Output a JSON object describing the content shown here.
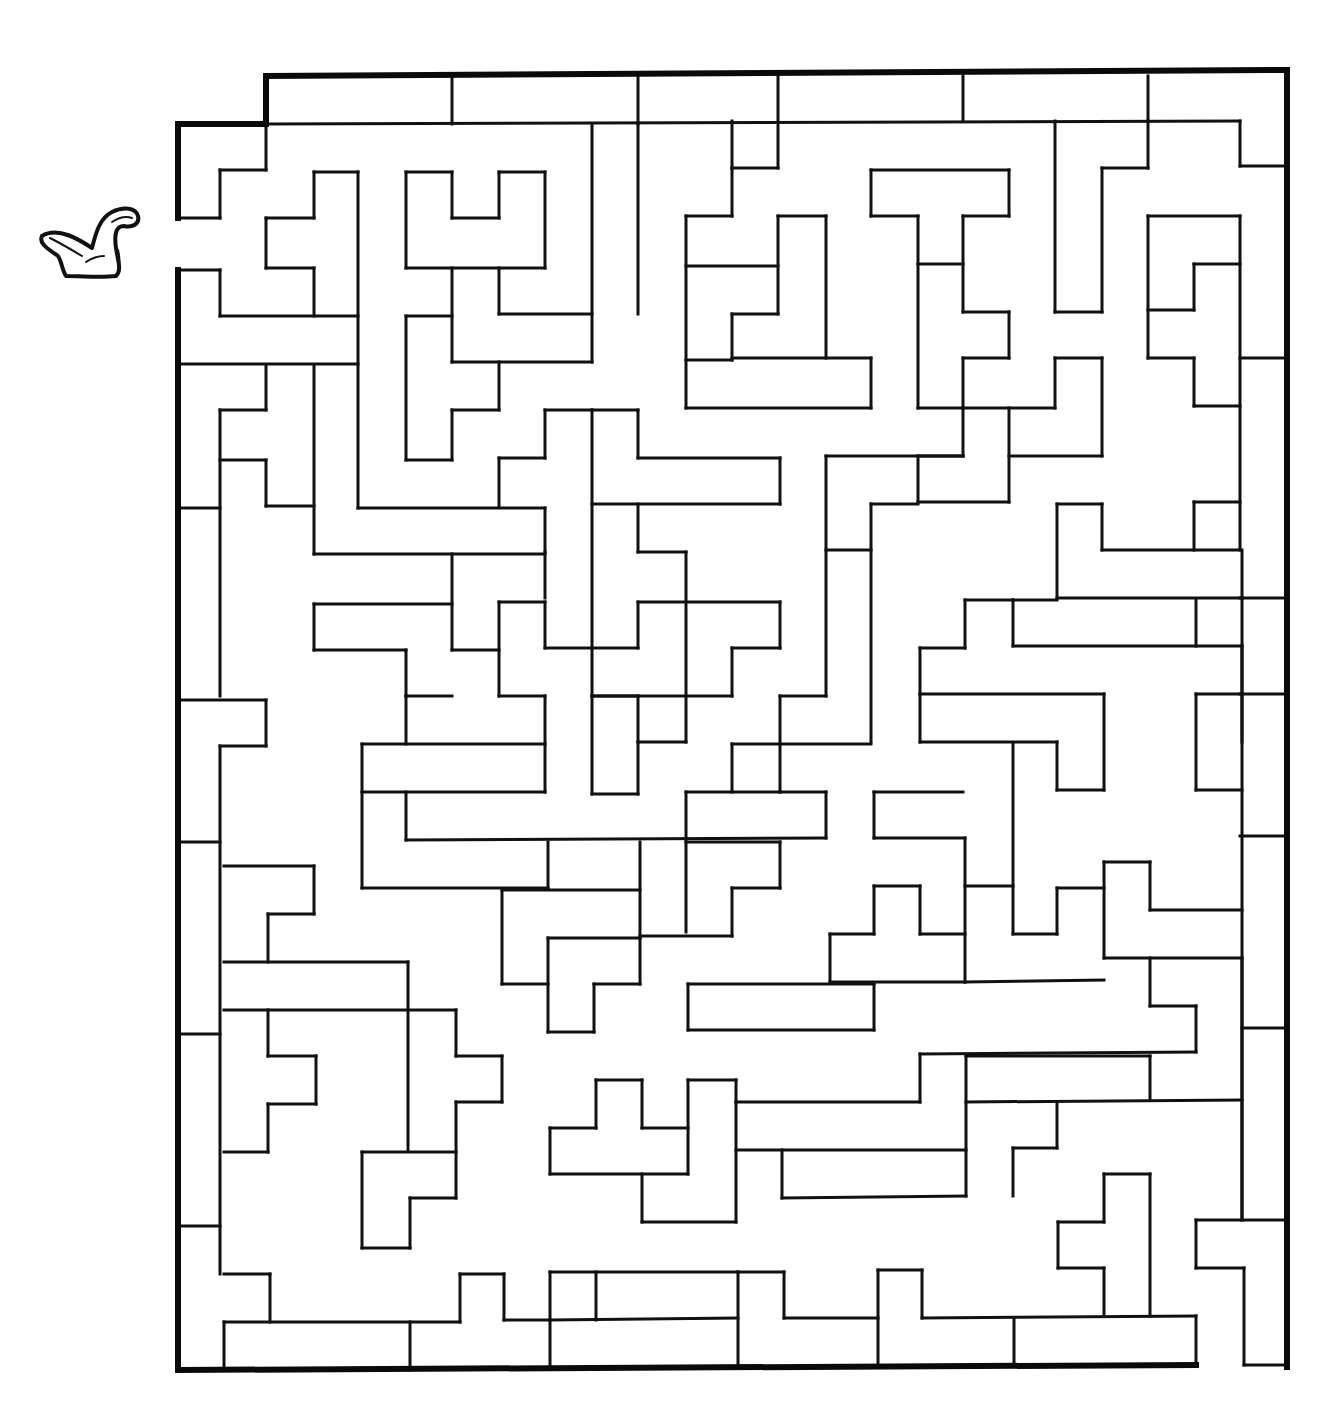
{
  "puzzle": {
    "type": "maze",
    "entrance": {
      "side": "left",
      "x": 178,
      "y_from": 218,
      "y_to": 270
    },
    "exit": {
      "side": "bottom-right",
      "x_from": 1196,
      "x_to": 1287,
      "y": 1367
    },
    "icon": "bird-icon",
    "colors": {
      "background": "#ffffff",
      "wall": "#111111"
    }
  },
  "border": [
    [
      266,
      76,
      1287,
      70
    ],
    [
      1287,
      70,
      1287,
      1367
    ],
    [
      178,
      1370,
      1196,
      1365
    ],
    [
      178,
      124,
      266,
      124
    ],
    [
      266,
      76,
      266,
      124
    ],
    [
      178,
      124,
      178,
      218
    ],
    [
      178,
      270,
      178,
      1370
    ]
  ],
  "walls": [
    [
      266,
      124,
      1240,
      121
    ],
    [
      452,
      76,
      452,
      124
    ],
    [
      638,
      76,
      638,
      124
    ],
    [
      778,
      76,
      778,
      168
    ],
    [
      963,
      76,
      963,
      121
    ],
    [
      1148,
      76,
      1148,
      121
    ],
    [
      1240,
      121,
      1240,
      166
    ],
    [
      1240,
      166,
      1287,
      166
    ],
    [
      266,
      124,
      266,
      170
    ],
    [
      220,
      170,
      266,
      170
    ],
    [
      220,
      170,
      220,
      218
    ],
    [
      178,
      218,
      220,
      218
    ],
    [
      314,
      172,
      358,
      172
    ],
    [
      314,
      172,
      314,
      218
    ],
    [
      266,
      218,
      314,
      218
    ],
    [
      266,
      218,
      266,
      268
    ],
    [
      266,
      268,
      314,
      268
    ],
    [
      314,
      268,
      314,
      316
    ],
    [
      358,
      172,
      358,
      508
    ],
    [
      220,
      270,
      220,
      316
    ],
    [
      220,
      316,
      358,
      316
    ],
    [
      178,
      270,
      220,
      270
    ],
    [
      178,
      364,
      358,
      364
    ],
    [
      406,
      172,
      452,
      172
    ],
    [
      452,
      172,
      452,
      218
    ],
    [
      452,
      218,
      499,
      218
    ],
    [
      499,
      172,
      499,
      218
    ],
    [
      499,
      172,
      545,
      172
    ],
    [
      545,
      172,
      545,
      268
    ],
    [
      406,
      172,
      406,
      268
    ],
    [
      406,
      268,
      545,
      268
    ],
    [
      452,
      268,
      452,
      362
    ],
    [
      499,
      268,
      499,
      314
    ],
    [
      499,
      314,
      592,
      314
    ],
    [
      592,
      124,
      592,
      362
    ],
    [
      452,
      362,
      592,
      362
    ],
    [
      638,
      124,
      638,
      314
    ],
    [
      406,
      316,
      452,
      316
    ],
    [
      406,
      316,
      406,
      460
    ],
    [
      406,
      460,
      452,
      460
    ],
    [
      452,
      410,
      452,
      460
    ],
    [
      452,
      410,
      499,
      410
    ],
    [
      499,
      362,
      499,
      410
    ],
    [
      732,
      121,
      732,
      168
    ],
    [
      732,
      168,
      778,
      168
    ],
    [
      732,
      168,
      732,
      216
    ],
    [
      686,
      216,
      732,
      216
    ],
    [
      686,
      216,
      686,
      408
    ],
    [
      686,
      266,
      778,
      266
    ],
    [
      778,
      216,
      778,
      314
    ],
    [
      778,
      216,
      826,
      216
    ],
    [
      826,
      216,
      826,
      358
    ],
    [
      732,
      314,
      778,
      314
    ],
    [
      732,
      314,
      732,
      360
    ],
    [
      732,
      358,
      871,
      358
    ],
    [
      686,
      360,
      732,
      360
    ],
    [
      686,
      408,
      871,
      408
    ],
    [
      871,
      358,
      871,
      408
    ],
    [
      871,
      170,
      1009,
      170
    ],
    [
      871,
      170,
      871,
      216
    ],
    [
      871,
      216,
      918,
      216
    ],
    [
      918,
      216,
      918,
      408
    ],
    [
      963,
      216,
      1009,
      216
    ],
    [
      1009,
      170,
      1009,
      216
    ],
    [
      918,
      264,
      963,
      264
    ],
    [
      963,
      216,
      963,
      312
    ],
    [
      963,
      312,
      1009,
      312
    ],
    [
      1009,
      312,
      1009,
      358
    ],
    [
      963,
      358,
      1009,
      358
    ],
    [
      963,
      358,
      963,
      408
    ],
    [
      918,
      408,
      1055,
      408
    ],
    [
      1055,
      121,
      1055,
      312
    ],
    [
      1055,
      312,
      1102,
      312
    ],
    [
      1102,
      168,
      1102,
      312
    ],
    [
      1102,
      168,
      1148,
      168
    ],
    [
      1148,
      121,
      1148,
      168
    ],
    [
      1148,
      216,
      1240,
      216
    ],
    [
      1148,
      216,
      1148,
      358
    ],
    [
      1148,
      310,
      1194,
      310
    ],
    [
      1194,
      264,
      1194,
      310
    ],
    [
      1194,
      264,
      1240,
      264
    ],
    [
      1240,
      216,
      1240,
      550
    ],
    [
      1148,
      358,
      1194,
      358
    ],
    [
      1194,
      358,
      1194,
      406
    ],
    [
      1194,
      406,
      1240,
      406
    ],
    [
      1240,
      358,
      1287,
      358
    ],
    [
      1055,
      358,
      1102,
      358
    ],
    [
      1055,
      358,
      1055,
      408
    ],
    [
      1102,
      358,
      1102,
      456
    ],
    [
      1009,
      456,
      1102,
      456
    ],
    [
      1009,
      408,
      1009,
      502
    ],
    [
      963,
      408,
      963,
      456
    ],
    [
      918,
      456,
      963,
      456
    ],
    [
      918,
      456,
      918,
      502
    ],
    [
      918,
      502,
      1009,
      502
    ],
    [
      826,
      456,
      963,
      456
    ],
    [
      826,
      456,
      826,
      696
    ],
    [
      871,
      504,
      918,
      504
    ],
    [
      871,
      504,
      871,
      742
    ],
    [
      826,
      550,
      871,
      550
    ],
    [
      178,
      508,
      220,
      508
    ],
    [
      220,
      410,
      266,
      410
    ],
    [
      220,
      410,
      220,
      696
    ],
    [
      266,
      366,
      266,
      410
    ],
    [
      220,
      460,
      266,
      460
    ],
    [
      266,
      460,
      266,
      506
    ],
    [
      266,
      506,
      314,
      506
    ],
    [
      314,
      366,
      314,
      554
    ],
    [
      314,
      554,
      545,
      554
    ],
    [
      358,
      508,
      545,
      508
    ],
    [
      545,
      508,
      545,
      552
    ],
    [
      545,
      410,
      592,
      410
    ],
    [
      545,
      410,
      545,
      458
    ],
    [
      499,
      458,
      545,
      458
    ],
    [
      499,
      458,
      499,
      506
    ],
    [
      592,
      410,
      638,
      410
    ],
    [
      638,
      410,
      638,
      458
    ],
    [
      638,
      458,
      780,
      458
    ],
    [
      780,
      458,
      780,
      504
    ],
    [
      592,
      504,
      780,
      504
    ],
    [
      592,
      410,
      592,
      794
    ],
    [
      638,
      504,
      638,
      552
    ],
    [
      638,
      552,
      686,
      552
    ],
    [
      686,
      552,
      686,
      742
    ],
    [
      545,
      552,
      545,
      598
    ],
    [
      452,
      554,
      452,
      650
    ],
    [
      314,
      604,
      452,
      604
    ],
    [
      314,
      604,
      314,
      650
    ],
    [
      314,
      650,
      406,
      650
    ],
    [
      406,
      650,
      406,
      696
    ],
    [
      406,
      696,
      452,
      696
    ],
    [
      452,
      650,
      499,
      650
    ],
    [
      499,
      602,
      545,
      602
    ],
    [
      499,
      602,
      499,
      696
    ],
    [
      545,
      602,
      545,
      648
    ],
    [
      545,
      648,
      638,
      648
    ],
    [
      638,
      602,
      638,
      648
    ],
    [
      638,
      602,
      780,
      602
    ],
    [
      780,
      602,
      780,
      648
    ],
    [
      732,
      648,
      780,
      648
    ],
    [
      732,
      648,
      732,
      696
    ],
    [
      592,
      696,
      732,
      696
    ],
    [
      499,
      696,
      545,
      696
    ],
    [
      545,
      696,
      545,
      792
    ],
    [
      406,
      696,
      406,
      744
    ],
    [
      362,
      744,
      545,
      744
    ],
    [
      362,
      744,
      362,
      888
    ],
    [
      362,
      792,
      545,
      792
    ],
    [
      592,
      696,
      638,
      696
    ],
    [
      638,
      696,
      638,
      742
    ],
    [
      638,
      742,
      686,
      742
    ],
    [
      592,
      794,
      638,
      794
    ],
    [
      638,
      742,
      638,
      794
    ],
    [
      780,
      696,
      826,
      696
    ],
    [
      780,
      696,
      780,
      792
    ],
    [
      732,
      744,
      871,
      744
    ],
    [
      732,
      744,
      732,
      792
    ],
    [
      686,
      792,
      780,
      792
    ],
    [
      686,
      792,
      686,
      932
    ],
    [
      780,
      792,
      826,
      792
    ],
    [
      826,
      792,
      826,
      838
    ],
    [
      406,
      840,
      826,
      838
    ],
    [
      406,
      792,
      406,
      840
    ],
    [
      178,
      700,
      266,
      700
    ],
    [
      266,
      700,
      266,
      746
    ],
    [
      220,
      746,
      266,
      746
    ],
    [
      220,
      746,
      220,
      1274
    ],
    [
      178,
      842,
      220,
      842
    ],
    [
      224,
      866,
      314,
      866
    ],
    [
      314,
      866,
      314,
      914
    ],
    [
      268,
      914,
      314,
      914
    ],
    [
      268,
      914,
      268,
      962
    ],
    [
      224,
      962,
      408,
      962
    ],
    [
      408,
      962,
      408,
      1150
    ],
    [
      224,
      1010,
      456,
      1010
    ],
    [
      456,
      1010,
      456,
      1056
    ],
    [
      456,
      1056,
      502,
      1056
    ],
    [
      502,
      1056,
      502,
      1102
    ],
    [
      456,
      1102,
      502,
      1102
    ],
    [
      456,
      1102,
      456,
      1198
    ],
    [
      268,
      1010,
      268,
      1056
    ],
    [
      268,
      1056,
      316,
      1056
    ],
    [
      316,
      1056,
      316,
      1104
    ],
    [
      268,
      1104,
      316,
      1104
    ],
    [
      268,
      1104,
      268,
      1152
    ],
    [
      224,
      1152,
      268,
      1152
    ],
    [
      178,
      1034,
      220,
      1034
    ],
    [
      178,
      1226,
      220,
      1226
    ],
    [
      362,
      1152,
      456,
      1152
    ],
    [
      362,
      1152,
      362,
      1248
    ],
    [
      362,
      1248,
      410,
      1248
    ],
    [
      410,
      1198,
      410,
      1248
    ],
    [
      410,
      1198,
      456,
      1198
    ],
    [
      362,
      888,
      548,
      888
    ],
    [
      548,
      842,
      548,
      888
    ],
    [
      502,
      890,
      640,
      890
    ],
    [
      640,
      842,
      640,
      938
    ],
    [
      502,
      890,
      502,
      984
    ],
    [
      502,
      984,
      548,
      984
    ],
    [
      548,
      938,
      640,
      938
    ],
    [
      548,
      938,
      548,
      1032
    ],
    [
      548,
      1032,
      594,
      1032
    ],
    [
      594,
      984,
      594,
      1032
    ],
    [
      594,
      984,
      640,
      984
    ],
    [
      640,
      938,
      640,
      984
    ],
    [
      640,
      936,
      732,
      936
    ],
    [
      732,
      888,
      732,
      936
    ],
    [
      732,
      888,
      780,
      888
    ],
    [
      780,
      842,
      780,
      888
    ],
    [
      686,
      842,
      780,
      842
    ],
    [
      874,
      792,
      963,
      792
    ],
    [
      874,
      792,
      874,
      838
    ],
    [
      874,
      838,
      965,
      838
    ],
    [
      965,
      838,
      965,
      982
    ],
    [
      1013,
      744,
      1013,
      934
    ],
    [
      1013,
      934,
      1057,
      934
    ],
    [
      1057,
      888,
      1057,
      934
    ],
    [
      1057,
      888,
      1104,
      888
    ],
    [
      1104,
      862,
      1104,
      958
    ],
    [
      1104,
      862,
      1150,
      862
    ],
    [
      1150,
      862,
      1150,
      910
    ],
    [
      1150,
      910,
      1242,
      910
    ],
    [
      965,
      886,
      1013,
      886
    ],
    [
      920,
      886,
      920,
      934
    ],
    [
      874,
      886,
      920,
      886
    ],
    [
      874,
      886,
      874,
      934
    ],
    [
      830,
      934,
      874,
      934
    ],
    [
      830,
      934,
      830,
      982
    ],
    [
      920,
      934,
      965,
      934
    ],
    [
      830,
      982,
      965,
      982
    ],
    [
      965,
      982,
      1104,
      980
    ],
    [
      1104,
      958,
      1242,
      958
    ],
    [
      1150,
      958,
      1150,
      1006
    ],
    [
      1150,
      1006,
      1196,
      1006
    ],
    [
      1196,
      1006,
      1196,
      1052
    ],
    [
      920,
      1054,
      1196,
      1052
    ],
    [
      920,
      1054,
      920,
      1102
    ],
    [
      736,
      1102,
      920,
      1102
    ],
    [
      736,
      1080,
      736,
      1102
    ],
    [
      688,
      1080,
      736,
      1080
    ],
    [
      688,
      1080,
      688,
      1174
    ],
    [
      688,
      984,
      874,
      984
    ],
    [
      688,
      984,
      688,
      1030
    ],
    [
      688,
      1030,
      874,
      1030
    ],
    [
      874,
      984,
      874,
      1030
    ],
    [
      550,
      1128,
      596,
      1128
    ],
    [
      596,
      1080,
      596,
      1128
    ],
    [
      596,
      1080,
      642,
      1080
    ],
    [
      642,
      1080,
      642,
      1128
    ],
    [
      642,
      1128,
      688,
      1128
    ],
    [
      550,
      1128,
      550,
      1174
    ],
    [
      550,
      1174,
      688,
      1174
    ],
    [
      642,
      1174,
      642,
      1222
    ],
    [
      642,
      1222,
      736,
      1222
    ],
    [
      736,
      1102,
      736,
      1222
    ],
    [
      736,
      1150,
      966,
      1150
    ],
    [
      782,
      1150,
      782,
      1198
    ],
    [
      782,
      1198,
      966,
      1196
    ],
    [
      966,
      1056,
      966,
      1196
    ],
    [
      966,
      1102,
      1242,
      1100
    ],
    [
      966,
      1056,
      1150,
      1056
    ],
    [
      1150,
      1056,
      1150,
      1100
    ],
    [
      1057,
      1102,
      1057,
      1148
    ],
    [
      1013,
      1148,
      1057,
      1148
    ],
    [
      1013,
      1148,
      1013,
      1196
    ],
    [
      1242,
      958,
      1242,
      1220
    ],
    [
      1242,
      550,
      1242,
      1220
    ],
    [
      1240,
      598,
      1287,
      598
    ],
    [
      1240,
      694,
      1287,
      694
    ],
    [
      1240,
      836,
      1287,
      836
    ],
    [
      1242,
      1028,
      1287,
      1028
    ],
    [
      1196,
      1220,
      1287,
      1220
    ],
    [
      1196,
      1220,
      1196,
      1268
    ],
    [
      1196,
      1268,
      1244,
      1268
    ],
    [
      1244,
      1268,
      1244,
      1365
    ],
    [
      1244,
      1365,
      1287,
      1365
    ],
    [
      1057,
      504,
      1102,
      504
    ],
    [
      1057,
      504,
      1057,
      598
    ],
    [
      1102,
      504,
      1102,
      550
    ],
    [
      1102,
      550,
      1240,
      550
    ],
    [
      1194,
      502,
      1240,
      502
    ],
    [
      1194,
      502,
      1194,
      550
    ],
    [
      1057,
      598,
      1242,
      598
    ],
    [
      1013,
      600,
      1057,
      600
    ],
    [
      965,
      600,
      1013,
      600
    ],
    [
      965,
      600,
      965,
      648
    ],
    [
      920,
      648,
      965,
      648
    ],
    [
      920,
      648,
      920,
      694
    ],
    [
      920,
      694,
      1104,
      694
    ],
    [
      1013,
      600,
      1013,
      646
    ],
    [
      1013,
      646,
      1242,
      646
    ],
    [
      1196,
      600,
      1196,
      646
    ],
    [
      1242,
      646,
      1242,
      742
    ],
    [
      920,
      694,
      920,
      742
    ],
    [
      920,
      742,
      1057,
      742
    ],
    [
      1057,
      742,
      1057,
      790
    ],
    [
      1057,
      790,
      1104,
      790
    ],
    [
      1104,
      694,
      1104,
      790
    ],
    [
      1196,
      694,
      1242,
      694
    ],
    [
      1196,
      694,
      1196,
      790
    ],
    [
      1196,
      790,
      1242,
      790
    ],
    [
      1058,
      1222,
      1104,
      1222
    ],
    [
      1104,
      1174,
      1150,
      1174
    ],
    [
      1104,
      1174,
      1104,
      1222
    ],
    [
      1058,
      1222,
      1058,
      1268
    ],
    [
      1058,
      1268,
      1104,
      1268
    ],
    [
      1104,
      1268,
      1104,
      1316
    ],
    [
      1150,
      1174,
      1150,
      1316
    ],
    [
      224,
      1274,
      270,
      1274
    ],
    [
      270,
      1274,
      270,
      1322
    ],
    [
      224,
      1322,
      460,
      1322
    ],
    [
      460,
      1274,
      460,
      1322
    ],
    [
      460,
      1274,
      504,
      1274
    ],
    [
      504,
      1274,
      504,
      1320
    ],
    [
      504,
      1320,
      550,
      1320
    ],
    [
      550,
      1272,
      550,
      1368
    ],
    [
      550,
      1272,
      738,
      1272
    ],
    [
      596,
      1272,
      596,
      1320
    ],
    [
      550,
      1320,
      738,
      1318
    ],
    [
      738,
      1272,
      738,
      1368
    ],
    [
      738,
      1272,
      784,
      1272
    ],
    [
      784,
      1272,
      784,
      1318
    ],
    [
      784,
      1318,
      878,
      1318
    ],
    [
      878,
      1270,
      878,
      1366
    ],
    [
      878,
      1270,
      922,
      1270
    ],
    [
      922,
      1270,
      922,
      1318
    ],
    [
      922,
      1318,
      1196,
      1316
    ],
    [
      1014,
      1318,
      1014,
      1366
    ],
    [
      1196,
      1316,
      1196,
      1365
    ],
    [
      224,
      1322,
      224,
      1370
    ],
    [
      410,
      1322,
      410,
      1370
    ]
  ]
}
